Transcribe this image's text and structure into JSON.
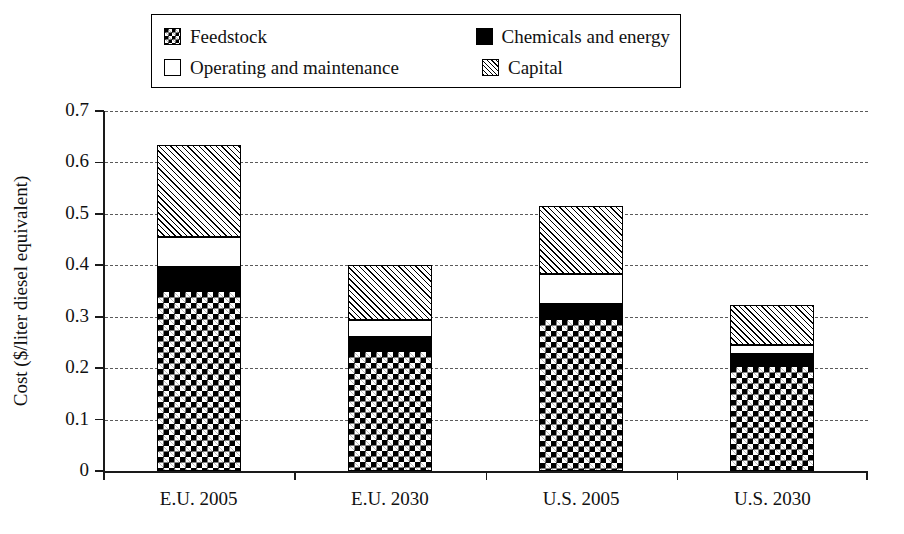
{
  "legend": {
    "items": [
      {
        "key": "feedstock",
        "label": "Feedstock",
        "swatch": "checkerboard-swatch"
      },
      {
        "key": "chemicals",
        "label": "Chemicals and energy",
        "swatch": "solid-black-swatch"
      },
      {
        "key": "operating",
        "label": "Operating and maintenance",
        "swatch": "white-swatch"
      },
      {
        "key": "capital",
        "label": "Capital",
        "swatch": "diagonal-hatch-swatch"
      }
    ]
  },
  "chart_data": {
    "type": "bar",
    "stacked": true,
    "title": "",
    "xlabel": "",
    "ylabel": "Cost ($/liter diesel equivalent)",
    "categories": [
      "E.U. 2005",
      "E.U. 2030",
      "U.S. 2005",
      "U.S. 2030"
    ],
    "ylim": [
      0,
      0.7
    ],
    "ytick_labels": [
      "0",
      "0.1",
      "0.2",
      "0.3",
      "0.4",
      "0.5",
      "0.6",
      "0.7"
    ],
    "ytick_values": [
      0,
      0.1,
      0.2,
      0.3,
      0.4,
      0.5,
      0.6,
      0.7
    ],
    "grid": "horizontal-dashed",
    "legend_position": "top",
    "series": [
      {
        "name": "Feedstock",
        "fill": "checkerboard",
        "values": [
          0.35,
          0.233,
          0.295,
          0.205
        ]
      },
      {
        "name": "Chemicals and energy",
        "fill": "solid-black",
        "values": [
          0.047,
          0.027,
          0.03,
          0.023
        ]
      },
      {
        "name": "Operating and maintenance",
        "fill": "white",
        "values": [
          0.058,
          0.034,
          0.058,
          0.017
        ]
      },
      {
        "name": "Capital",
        "fill": "diagonal-hatch",
        "values": [
          0.178,
          0.107,
          0.132,
          0.078
        ]
      }
    ],
    "totals": [
      0.633,
      0.401,
      0.515,
      0.323
    ]
  }
}
